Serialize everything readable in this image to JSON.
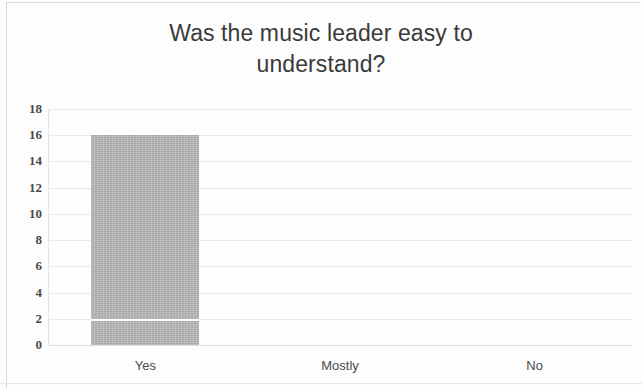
{
  "chart_data": {
    "type": "bar",
    "title": "Was the music leader easy to\nunderstand?",
    "title_line_1": "Was the music leader easy to",
    "title_line_2": "understand?",
    "categories": [
      "Yes",
      "Mostly",
      "No"
    ],
    "values": [
      16,
      0,
      0
    ],
    "xlabel": "",
    "ylabel": "",
    "ylim": [
      0,
      18
    ],
    "ytick_step": 2,
    "yticks": [
      18,
      16,
      14,
      12,
      10,
      8,
      6,
      4,
      2,
      0
    ],
    "grid": true,
    "legend": false,
    "bar_color": "#b4b4b4",
    "gridline_color": "#e9e9e9",
    "title_color": "#3a3a3a",
    "axis_text_color": "#4a4a4a",
    "background_color": "#fdfdfd",
    "annotations": [
      {
        "name": "scan-streak",
        "description": "thin white horizontal streak across the Yes bar near value 2",
        "category": "Yes",
        "value": 2
      }
    ]
  }
}
